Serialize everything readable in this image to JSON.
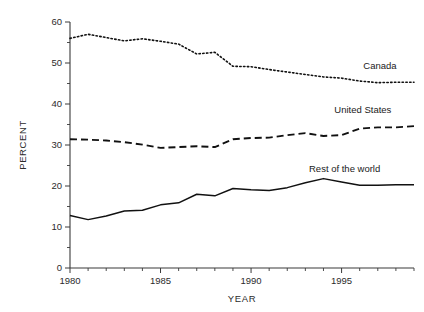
{
  "chart_data": {
    "type": "line",
    "title": "",
    "xlabel": "YEAR",
    "ylabel": "PERCENT",
    "xlim": [
      1980,
      1999
    ],
    "ylim": [
      0,
      60
    ],
    "grid": false,
    "legend_position": "inline-right-of-series",
    "x": [
      1980,
      1981,
      1982,
      1983,
      1984,
      1985,
      1986,
      1987,
      1988,
      1989,
      1990,
      1991,
      1992,
      1993,
      1994,
      1995,
      1996,
      1997,
      1998,
      1999
    ],
    "x_tick_labels": [
      "1980",
      "1985",
      "1990",
      "1995"
    ],
    "x_tick_values": [
      1980,
      1985,
      1990,
      1995
    ],
    "x_minor_tick_interval": 1,
    "y_tick_labels": [
      "0",
      "10",
      "20",
      "30",
      "40",
      "50",
      "60"
    ],
    "y_tick_values": [
      0,
      10,
      20,
      30,
      40,
      50,
      60
    ],
    "y_minor_tick_values": [
      5,
      15,
      25,
      35,
      45,
      55
    ],
    "series": [
      {
        "name": "Canada",
        "style": "dotted",
        "color": "#111111",
        "label_x": 1996.2,
        "label_y": 48.6,
        "values": [
          56.0,
          57.0,
          56.2,
          55.4,
          55.9,
          55.3,
          54.6,
          52.2,
          52.6,
          49.2,
          49.1,
          48.4,
          47.8,
          47.2,
          46.6,
          46.3,
          45.6,
          45.2,
          45.3,
          45.3
        ]
      },
      {
        "name": "United States",
        "style": "dashed",
        "color": "#111111",
        "label_x": 1994.6,
        "label_y": 37.9,
        "values": [
          31.4,
          31.3,
          31.1,
          30.7,
          30.1,
          29.3,
          29.5,
          29.7,
          29.5,
          31.4,
          31.7,
          31.8,
          32.4,
          32.9,
          32.2,
          32.4,
          34.0,
          34.3,
          34.3,
          34.6
        ]
      },
      {
        "name": "Rest of the world",
        "style": "solid",
        "color": "#111111",
        "label_x": 1993.2,
        "label_y": 23.4,
        "values": [
          12.8,
          11.8,
          12.7,
          13.9,
          14.1,
          15.4,
          15.9,
          18.0,
          17.6,
          19.4,
          19.1,
          18.9,
          19.6,
          20.8,
          21.8,
          21.0,
          20.2,
          20.2,
          20.3,
          20.3
        ]
      }
    ]
  }
}
